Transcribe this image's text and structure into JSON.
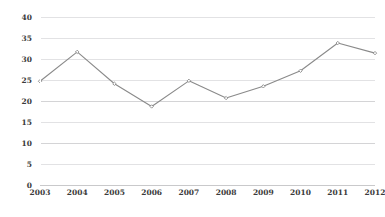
{
  "chart_data": {
    "type": "line",
    "title": "",
    "subtitle": "",
    "xlabel": "",
    "ylabel": "",
    "categories": [
      "2003",
      "2004",
      "2005",
      "2006",
      "2007",
      "2008",
      "2009",
      "2010",
      "2011",
      "2012"
    ],
    "values": [
      24.7,
      31.7,
      24.1,
      18.7,
      24.8,
      20.7,
      23.5,
      27.2,
      33.8,
      31.4
    ],
    "series": [
      {
        "name": "series-1",
        "values": [
          24.7,
          31.7,
          24.1,
          18.7,
          24.8,
          20.7,
          23.5,
          27.2,
          33.8,
          31.4
        ]
      }
    ],
    "ylim": [
      0,
      40
    ],
    "ytick_step": 5,
    "yticks": [
      "40",
      "35",
      "30",
      "25",
      "20",
      "15",
      "10",
      "5",
      "0"
    ],
    "ytick_values": [
      40,
      35,
      30,
      25,
      20,
      15,
      10,
      5,
      0
    ],
    "grid": true,
    "grid_axis": "y",
    "legend": false,
    "legend_position": "none",
    "markers": true,
    "colors": {
      "line": "#8a8a8a",
      "marker_fill": "#ffffff",
      "marker_stroke": "#7d7d7d",
      "gridline": "#e2e2e4",
      "baseline": "#c9c9cb",
      "tick_label": "#3b3b3b",
      "background": "#ffffff"
    }
  },
  "chart": {
    "title_clipped": "",
    "plot": {
      "left": 40,
      "top": 17,
      "width": 335,
      "height": 168
    }
  }
}
